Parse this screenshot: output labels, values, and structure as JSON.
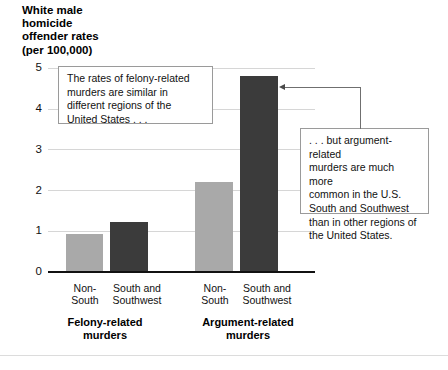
{
  "chart_data": {
    "type": "bar",
    "title": "White male homicide offender rates (per 100,000)",
    "ylabel": "White male\nhomicide\noffender rates\n(per 100,000)",
    "xlabel": "",
    "ylim": [
      0,
      5
    ],
    "yticks": [
      "0",
      "1",
      "2",
      "3",
      "4",
      "5"
    ],
    "grid": true,
    "legend": "none",
    "categories": [
      "Non-South",
      "South and Southwest",
      "Non-South",
      "South and Southwest"
    ],
    "groups": [
      {
        "name": "Felony-related murders",
        "label": "Felony-related\nmurders",
        "bars": [
          {
            "category": "Non-\nSouth",
            "value": 0.9,
            "color": "#a9a9a9"
          },
          {
            "category": "South and\nSouthwest",
            "value": 1.2,
            "color": "#3b3b3b"
          }
        ]
      },
      {
        "name": "Argument-related murders",
        "label": "Argument-related\nmurders",
        "bars": [
          {
            "category": "Non-\nSouth",
            "value": 2.2,
            "color": "#a9a9a9"
          },
          {
            "category": "South and\nSouthwest",
            "value": 4.8,
            "color": "#3b3b3b"
          }
        ]
      }
    ],
    "values": [
      0.9,
      1.2,
      2.2,
      4.8
    ],
    "annotations": [
      {
        "id": "felony-note",
        "text": "The rates of felony-related\nmurders are similar in\ndifferent regions of the\nUnited States . . ."
      },
      {
        "id": "argument-note",
        "text": ". . . but argument-related\nmurders are much more\ncommon in the U.S.\nSouth and Southwest\nthan in other regions of\nthe United States.",
        "points_to": "South and Southwest argument-related bar"
      }
    ]
  },
  "colors": {
    "bar_light": "#a9a9a9",
    "bar_dark": "#3b3b3b",
    "grid": "#d6d6d6",
    "axis": "#111111",
    "callout_border": "#9a9a9a",
    "leader": "#6f6f6f"
  }
}
